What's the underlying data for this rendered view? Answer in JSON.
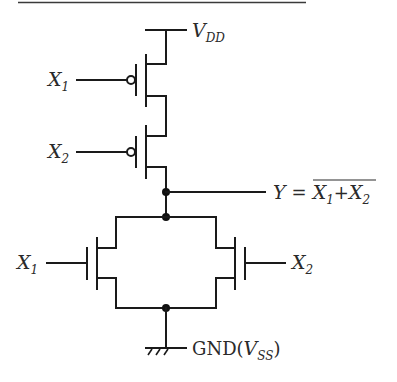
{
  "diagram": {
    "supply": {
      "label": "V",
      "sub": "DD"
    },
    "ground": {
      "label": "GND",
      "paren_open": "(",
      "var": "V",
      "sub": "SS",
      "paren_close": ")"
    },
    "output": {
      "lhs": "Y",
      "eq": "=",
      "expr": [
        {
          "var": "X",
          "sub": "1"
        },
        {
          "op": "+"
        },
        {
          "var": "X",
          "sub": "2"
        }
      ],
      "overline": true
    },
    "inputs": {
      "pmos1": {
        "var": "X",
        "sub": "1"
      },
      "pmos2": {
        "var": "X",
        "sub": "2"
      },
      "nmos1": {
        "var": "X",
        "sub": "1"
      },
      "nmos2": {
        "var": "X",
        "sub": "2"
      }
    },
    "transistors": [
      {
        "id": "pmos1",
        "type": "PMOS",
        "gate": "X1"
      },
      {
        "id": "pmos2",
        "type": "PMOS",
        "gate": "X2"
      },
      {
        "id": "nmos1",
        "type": "NMOS",
        "gate": "X1"
      },
      {
        "id": "nmos2",
        "type": "NMOS",
        "gate": "X2"
      }
    ],
    "colors": {
      "wire": "#1a1a1a",
      "text": "#2a2a2a"
    }
  }
}
